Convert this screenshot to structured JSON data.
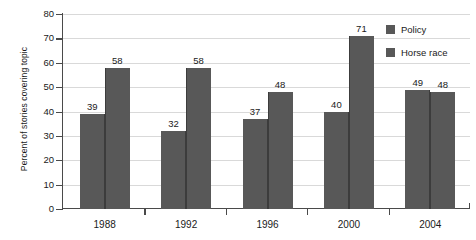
{
  "chart_data": {
    "type": "bar",
    "title": "",
    "xlabel": "",
    "ylabel": "Percent of stories covering topic",
    "categories": [
      "1988",
      "1992",
      "1996",
      "2000",
      "2004"
    ],
    "series": [
      {
        "name": "Policy",
        "values": [
          39,
          32,
          37,
          40,
          49
        ],
        "color": "#585858"
      },
      {
        "name": "Horse race",
        "values": [
          58,
          58,
          48,
          71,
          48
        ],
        "color": "#585858"
      }
    ],
    "ylim": [
      0,
      80
    ],
    "ytick_step": 10,
    "yticks": [
      0,
      10,
      20,
      30,
      40,
      50,
      60,
      70,
      80
    ],
    "ytick_labels": [
      "0",
      "10",
      "20",
      "30",
      "40",
      "50",
      "60",
      "70",
      "80"
    ],
    "grid": true,
    "grid_axis": "y",
    "legend_position": "top-right",
    "bar_labels_shown": true,
    "bars_touching": true
  },
  "legend": {
    "entries": [
      {
        "label": "Policy",
        "swatch": "#585858"
      },
      {
        "label": "Horse race",
        "swatch": "#585858"
      }
    ]
  },
  "axis": {
    "y_title": "Percent of stories covering topic"
  }
}
